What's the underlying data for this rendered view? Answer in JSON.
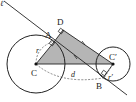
{
  "diagram": {
    "colors": {
      "stroke": "#222222",
      "shade": "#b5b5b5",
      "dash": "#555555",
      "background": "#ffffff"
    },
    "labels": {
      "line": "ℓ",
      "point_A": "A",
      "point_B": "B",
      "point_C": "C",
      "point_C_prime": "C′",
      "point_D": "D",
      "radius_r": "r",
      "radius_r_prime": "r′",
      "distance_d": "d"
    }
  }
}
